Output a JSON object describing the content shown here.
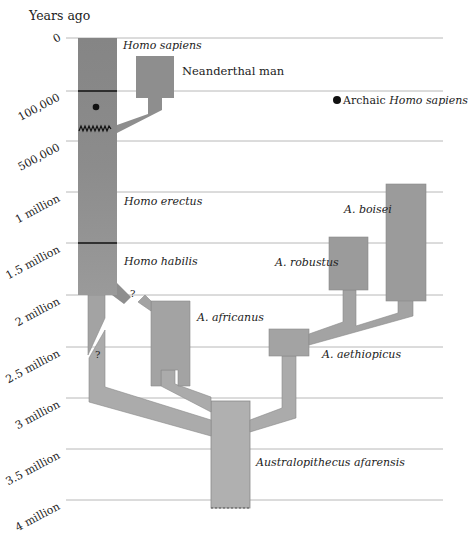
{
  "diagram": {
    "axis_title": "Years ago",
    "ticks": [
      {
        "label": "0",
        "y": 38
      },
      {
        "label": "100,000",
        "y": 91
      },
      {
        "label": "500,000",
        "y": 141
      },
      {
        "label": "1 million",
        "y": 192
      },
      {
        "label": "1.5 million",
        "y": 243
      },
      {
        "label": "2 million",
        "y": 295
      },
      {
        "label": "2.5 million",
        "y": 347
      },
      {
        "label": "3 million",
        "y": 398
      },
      {
        "label": "3.5 million",
        "y": 449
      },
      {
        "label": "4 million",
        "y": 500
      }
    ],
    "species": {
      "homo_sapiens": "Homo sapiens",
      "neanderthal": "Neanderthal man",
      "homo_erectus": "Homo erectus",
      "homo_habilis": "Homo habilis",
      "a_africanus": "A. africanus",
      "a_boisei": "A. boisei",
      "a_robustus": "A. robustus",
      "a_aethiopicus": "A. aethiopicus",
      "a_afarensis": "Australopithecus afarensis"
    },
    "legend": {
      "prefix": "Archaic ",
      "italic": "Homo sapiens"
    },
    "uncertain_marker": "?",
    "colors": {
      "homo_column": "#8a8a8a",
      "branch": "#a9a9a9",
      "robust": "#9b9b9b",
      "gridline": "#b5b5b5",
      "boundary": "#111111"
    }
  }
}
